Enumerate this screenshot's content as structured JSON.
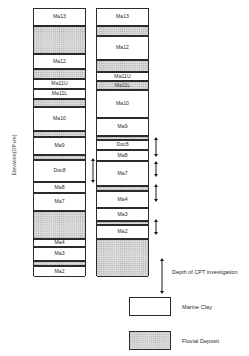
{
  "axis": {
    "y_label": "Elevation(OP+m)"
  },
  "annotation": {
    "cpt_depth_label": "Depth of CPT investigation"
  },
  "legend": {
    "items": [
      {
        "label": "Marine Clay",
        "pattern": "marine",
        "color": "#ffffff"
      },
      {
        "label": "Fluvial Deposit",
        "pattern": "fluvial",
        "color": "#dcdcdc"
      }
    ]
  },
  "chart_data": {
    "type": "table",
    "title": "",
    "xlabel": "",
    "ylabel": "Elevation(OP+m)",
    "columns": [
      {
        "name": "column-left",
        "layers": [
          {
            "label": "Ma13",
            "type": "marine",
            "top": 0,
            "height": 17
          },
          {
            "label": "",
            "type": "fluvial",
            "top": 17,
            "height": 28
          },
          {
            "label": "Ma12",
            "type": "marine",
            "top": 45,
            "height": 15
          },
          {
            "label": "",
            "type": "fluvial",
            "top": 60,
            "height": 10
          },
          {
            "label": "Ma11U",
            "type": "marine",
            "top": 70,
            "height": 10
          },
          {
            "label": "Ma11L",
            "type": "marine",
            "top": 80,
            "height": 10
          },
          {
            "label": "",
            "type": "fluvial",
            "top": 90,
            "height": 8
          },
          {
            "label": "Ma10",
            "type": "marine",
            "top": 98,
            "height": 24
          },
          {
            "label": "",
            "type": "fluvial",
            "top": 122,
            "height": 6
          },
          {
            "label": "Ma9",
            "type": "marine",
            "top": 128,
            "height": 18
          },
          {
            "label": "",
            "type": "fluvial",
            "top": 146,
            "height": 5
          },
          {
            "label": "Doc8",
            "type": "marine",
            "top": 151,
            "height": 22
          },
          {
            "label": "Ma8",
            "type": "marine",
            "top": 173,
            "height": 11
          },
          {
            "label": "Ma7",
            "type": "marine",
            "top": 184,
            "height": 18
          },
          {
            "label": "",
            "type": "fluvial",
            "top": 202,
            "height": 28
          },
          {
            "label": "Ma4",
            "type": "marine",
            "top": 230,
            "height": 8
          },
          {
            "label": "Ma3",
            "type": "marine",
            "top": 238,
            "height": 14
          },
          {
            "label": "",
            "type": "fluvial",
            "top": 252,
            "height": 5
          },
          {
            "label": "Ma2",
            "type": "marine",
            "top": 257,
            "height": 11
          }
        ],
        "cpt_intervals": [
          {
            "top": 149,
            "height": 25
          }
        ]
      },
      {
        "name": "column-right",
        "layers": [
          {
            "label": "Ma13",
            "type": "marine",
            "top": 0,
            "height": 17
          },
          {
            "label": "",
            "type": "fluvial",
            "top": 17,
            "height": 10
          },
          {
            "label": "Ma12",
            "type": "marine",
            "top": 27,
            "height": 24
          },
          {
            "label": "",
            "type": "fluvial",
            "top": 51,
            "height": 12
          },
          {
            "label": "Ma11U",
            "type": "marine",
            "top": 63,
            "height": 9
          },
          {
            "label": "Ma11L",
            "type": "fluvial",
            "top": 72,
            "height": 9
          },
          {
            "label": "Ma10",
            "type": "marine",
            "top": 81,
            "height": 28
          },
          {
            "label": "Ma9",
            "type": "marine",
            "top": 109,
            "height": 18
          },
          {
            "label": "",
            "type": "fluvial",
            "top": 127,
            "height": 4
          },
          {
            "label": "Doc8",
            "type": "marine",
            "top": 131,
            "height": 10
          },
          {
            "label": "Ma8",
            "type": "marine",
            "top": 141,
            "height": 11
          },
          {
            "label": "Ma7",
            "type": "marine",
            "top": 152,
            "height": 25
          },
          {
            "label": "",
            "type": "fluvial",
            "top": 177,
            "height": 5
          },
          {
            "label": "Ma4",
            "type": "marine",
            "top": 182,
            "height": 17
          },
          {
            "label": "Ma3",
            "type": "marine",
            "top": 199,
            "height": 13
          },
          {
            "label": "",
            "type": "fluvial",
            "top": 212,
            "height": 4
          },
          {
            "label": "Ma2",
            "type": "marine",
            "top": 216,
            "height": 14
          },
          {
            "label": "",
            "type": "fluvial",
            "top": 230,
            "height": 38
          }
        ],
        "cpt_intervals": [
          {
            "top": 128,
            "height": 20
          },
          {
            "top": 152,
            "height": 16
          },
          {
            "top": 175,
            "height": 18
          },
          {
            "top": 210,
            "height": 16
          }
        ]
      }
    ]
  }
}
